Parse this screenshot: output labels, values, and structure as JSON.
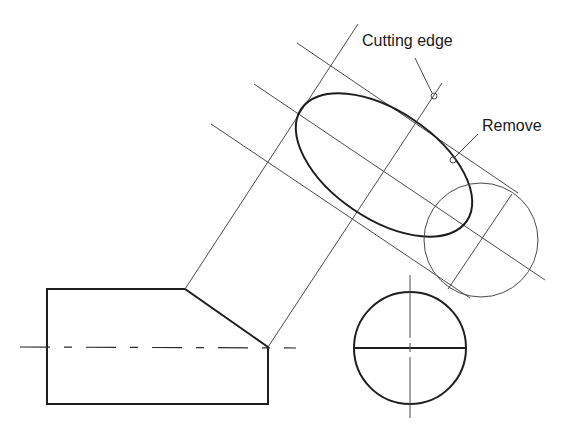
{
  "diagram": {
    "labels": {
      "cutting_edge": "Cutting edge",
      "remove": "Remove"
    },
    "colors": {
      "line": "#1e1e1e",
      "construction": "#4a4a4a",
      "background": "#ffffff"
    },
    "views": [
      "front-view",
      "auxiliary-view-ellipse",
      "auxiliary-circle",
      "end-view-circle"
    ]
  }
}
